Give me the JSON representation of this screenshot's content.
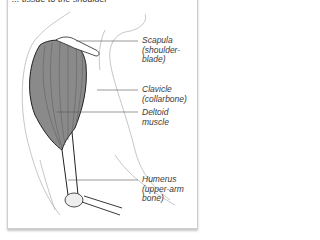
{
  "figure": {
    "top_caption": "... tissue to the shoulder",
    "labels": [
      {
        "id": "scapula",
        "text_line1": "Scapula",
        "text_line2": "(shoulder-",
        "text_line3": "blade)"
      },
      {
        "id": "clavicle",
        "text_line1": "Clavicle",
        "text_line2": "(collarbone)"
      },
      {
        "id": "deltoid",
        "text_line1": "Deltoid",
        "text_line2": "muscle"
      },
      {
        "id": "humerus",
        "text_line1": "Humerus",
        "text_line2": "(upper-arm",
        "text_line3": "bone)"
      }
    ]
  },
  "colors": {
    "muscle_fill": "#8a8a8a",
    "outline": "#222222",
    "skin_line": "#b8b8b8",
    "leader_line": "#555555"
  }
}
